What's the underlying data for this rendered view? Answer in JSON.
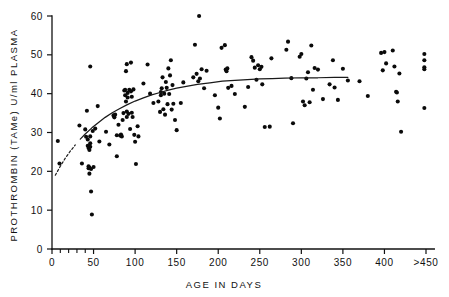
{
  "chart_data": {
    "type": "scatter",
    "title": "",
    "xlabel": "AGE IN DAYS",
    "ylabel": "PROTHROMBIN (TAMe) U/ml PLASMA",
    "xlim": [
      0,
      460
    ],
    "ylim": [
      0,
      60
    ],
    "grid": false,
    "legend": null,
    "xticks": [
      0,
      50,
      100,
      150,
      200,
      250,
      300,
      350,
      400,
      450
    ],
    "xtick_labels": [
      "0",
      "50",
      "100",
      "150",
      "200",
      "250",
      "300",
      "350",
      "400",
      ">450"
    ],
    "x_minor_ticks": [
      10,
      20,
      30,
      40
    ],
    "yticks": [
      0,
      10,
      20,
      30,
      40,
      50,
      60
    ],
    "ytick_labels": [
      "0",
      "10",
      "20",
      "30",
      "40",
      "50",
      "60"
    ],
    "series": [
      {
        "name": "observations",
        "marker": "filled-circle",
        "color": "#0a0a0a",
        "points": [
          [
            7,
            27.8
          ],
          [
            9,
            22.0
          ],
          [
            33,
            31.8
          ],
          [
            36,
            22.0
          ],
          [
            40,
            30.8
          ],
          [
            41,
            28.9
          ],
          [
            42,
            35.6
          ],
          [
            43,
            28.2
          ],
          [
            43,
            26.6
          ],
          [
            44,
            26.0
          ],
          [
            44,
            21.3
          ],
          [
            44,
            20.8
          ],
          [
            45,
            25.5
          ],
          [
            45,
            21.0
          ],
          [
            45,
            19.4
          ],
          [
            46,
            47.0
          ],
          [
            46,
            29.0
          ],
          [
            46,
            27.2
          ],
          [
            46,
            26.3
          ],
          [
            47,
            20.6
          ],
          [
            47,
            14.8
          ],
          [
            48,
            8.9
          ],
          [
            49,
            30.4
          ],
          [
            50,
            21.1
          ],
          [
            52,
            31.0
          ],
          [
            55,
            36.8
          ],
          [
            57,
            27.7
          ],
          [
            65,
            30.2
          ],
          [
            69,
            26.9
          ],
          [
            74,
            34.4
          ],
          [
            75,
            33.9
          ],
          [
            76,
            34.6
          ],
          [
            78,
            29.3
          ],
          [
            78,
            23.9
          ],
          [
            80,
            32.0
          ],
          [
            82,
            29.2
          ],
          [
            83,
            29.5
          ],
          [
            84,
            29.0
          ],
          [
            85,
            33.2
          ],
          [
            86,
            35.0
          ],
          [
            87,
            40.8
          ],
          [
            88,
            39.6
          ],
          [
            88,
            41.0
          ],
          [
            89,
            45.8
          ],
          [
            89,
            38.0
          ],
          [
            90,
            47.6
          ],
          [
            90,
            35.4
          ],
          [
            90,
            34.0
          ],
          [
            91,
            40.2
          ],
          [
            91,
            39.0
          ],
          [
            92,
            34.8
          ],
          [
            93,
            41.0
          ],
          [
            94,
            30.9
          ],
          [
            95,
            48.0
          ],
          [
            95,
            40.6
          ],
          [
            96,
            39.2
          ],
          [
            96,
            35.1
          ],
          [
            97,
            34.0
          ],
          [
            98,
            41.1
          ],
          [
            99,
            29.4
          ],
          [
            100,
            27.6
          ],
          [
            101,
            21.9
          ],
          [
            103,
            31.6
          ],
          [
            104,
            29.0
          ],
          [
            110,
            42.6
          ],
          [
            115,
            47.5
          ],
          [
            118,
            40.0
          ],
          [
            122,
            37.6
          ],
          [
            128,
            38.0
          ],
          [
            130,
            35.3
          ],
          [
            131,
            40.4
          ],
          [
            131,
            39.6
          ],
          [
            132,
            41.4
          ],
          [
            133,
            44.2
          ],
          [
            134,
            36.0
          ],
          [
            135,
            40.0
          ],
          [
            136,
            34.6
          ],
          [
            137,
            43.0
          ],
          [
            138,
            41.5
          ],
          [
            139,
            37.3
          ],
          [
            140,
            46.5
          ],
          [
            141,
            39.9
          ],
          [
            142,
            44.7
          ],
          [
            143,
            48.6
          ],
          [
            144,
            35.9
          ],
          [
            145,
            42.2
          ],
          [
            146,
            37.4
          ],
          [
            148,
            33.2
          ],
          [
            150,
            30.6
          ],
          [
            155,
            37.6
          ],
          [
            158,
            42.9
          ],
          [
            170,
            44.2
          ],
          [
            172,
            52.6
          ],
          [
            174,
            45.1
          ],
          [
            176,
            43.2
          ],
          [
            177,
            60.0
          ],
          [
            178,
            43.9
          ],
          [
            180,
            46.3
          ],
          [
            183,
            41.4
          ],
          [
            186,
            45.9
          ],
          [
            196,
            39.6
          ],
          [
            200,
            36.4
          ],
          [
            202,
            33.6
          ],
          [
            204,
            51.8
          ],
          [
            208,
            52.5
          ],
          [
            209,
            46.2
          ],
          [
            210,
            45.8
          ],
          [
            211,
            46.5
          ],
          [
            212,
            41.5
          ],
          [
            216,
            42.0
          ],
          [
            220,
            39.9
          ],
          [
            232,
            36.6
          ],
          [
            236,
            41.7
          ],
          [
            240,
            49.4
          ],
          [
            242,
            48.5
          ],
          [
            244,
            46.7
          ],
          [
            246,
            43.6
          ],
          [
            248,
            47.3
          ],
          [
            250,
            46.3
          ],
          [
            252,
            46.9
          ],
          [
            253,
            42.4
          ],
          [
            256,
            31.4
          ],
          [
            262,
            31.5
          ],
          [
            264,
            49.1
          ],
          [
            282,
            51.3
          ],
          [
            284,
            53.4
          ],
          [
            288,
            44.0
          ],
          [
            290,
            32.4
          ],
          [
            298,
            49.5
          ],
          [
            300,
            50.2
          ],
          [
            302,
            38.0
          ],
          [
            304,
            37.0
          ],
          [
            306,
            43.9
          ],
          [
            308,
            45.5
          ],
          [
            310,
            37.8
          ],
          [
            312,
            52.4
          ],
          [
            314,
            41.0
          ],
          [
            316,
            46.6
          ],
          [
            320,
            46.2
          ],
          [
            326,
            38.6
          ],
          [
            334,
            42.4
          ],
          [
            338,
            48.6
          ],
          [
            340,
            41.6
          ],
          [
            344,
            38.4
          ],
          [
            350,
            46.4
          ],
          [
            356,
            43.4
          ],
          [
            370,
            43.2
          ],
          [
            380,
            39.4
          ],
          [
            396,
            50.5
          ],
          [
            398,
            46.0
          ],
          [
            400,
            50.7
          ],
          [
            402,
            47.8
          ],
          [
            410,
            51.1
          ],
          [
            412,
            47.0
          ],
          [
            414,
            40.5
          ],
          [
            415,
            40.3
          ],
          [
            416,
            38.0
          ],
          [
            418,
            45.2
          ],
          [
            420,
            30.2
          ],
          [
            448,
            50.2
          ],
          [
            448,
            48.6
          ],
          [
            448,
            46.8
          ],
          [
            448,
            46.3
          ],
          [
            448,
            36.3
          ]
        ]
      }
    ],
    "fit_curve": {
      "name": "fitted trend",
      "style_solid": "solid",
      "style_extrapolated": "dashed",
      "dashed_segment_x": [
        4,
        30
      ],
      "solid_segment_x": [
        30,
        356
      ],
      "plateau_value": 44,
      "points": [
        [
          4,
          19.0
        ],
        [
          10,
          21.3
        ],
        [
          16,
          23.4
        ],
        [
          22,
          25.2
        ],
        [
          28,
          26.8
        ],
        [
          34,
          28.3
        ],
        [
          40,
          29.6
        ],
        [
          48,
          31.2
        ],
        [
          56,
          32.6
        ],
        [
          64,
          33.9
        ],
        [
          72,
          35.0
        ],
        [
          80,
          36.0
        ],
        [
          90,
          37.1
        ],
        [
          100,
          38.1
        ],
        [
          110,
          38.9
        ],
        [
          120,
          39.7
        ],
        [
          130,
          40.3
        ],
        [
          140,
          40.9
        ],
        [
          150,
          41.4
        ],
        [
          160,
          41.8
        ],
        [
          175,
          42.4
        ],
        [
          190,
          42.8
        ],
        [
          205,
          43.2
        ],
        [
          220,
          43.4
        ],
        [
          235,
          43.6
        ],
        [
          250,
          43.8
        ],
        [
          265,
          43.9
        ],
        [
          280,
          44.0
        ],
        [
          300,
          44.1
        ],
        [
          320,
          44.1
        ],
        [
          340,
          44.2
        ],
        [
          356,
          44.2
        ]
      ]
    }
  },
  "axes": {
    "x_title": "AGE IN DAYS",
    "y_title": "PROTHROMBIN (TAMe) U/ml PLASMA"
  }
}
